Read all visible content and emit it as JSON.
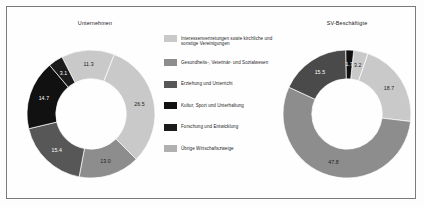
{
  "figure": {
    "background_color": "#fefefe",
    "border_color": "#7a7a7a"
  },
  "charts": {
    "left": {
      "title": "Unternehmen"
    },
    "right": {
      "title": "SV-Beschäftigte"
    }
  },
  "legend": {
    "items": [
      {
        "label": "Interessenvertretungen sowie kirchliche und sonstige Vereinigungen",
        "color": "#c9c9c9"
      },
      {
        "label": "Gesundheits-, Veterinär- und Sozialwesen",
        "color": "#8d8d8d"
      },
      {
        "label": "Erziehung und Unterricht",
        "color": "#575757"
      },
      {
        "label": "Kultur, Sport und Unterhaltung",
        "color": "#111111"
      },
      {
        "label": "Forschung und Entwicklung",
        "color": "#1b1b1b"
      },
      {
        "label": "Übrige Wirtschaftszweige",
        "color": "#b0b0b0"
      }
    ]
  },
  "chart_data": [
    {
      "type": "pie",
      "title": "Unternehmen",
      "donut": true,
      "hole_ratio": 0.55,
      "categories": [
        "Interessenvertretungen sowie kirchliche und sonstige Vereinigungen",
        "Übrige Wirtschaftszweige",
        "Gesundheits-, Veterinär- und Sozialwesen",
        "Erziehung und Unterricht",
        "Kultur, Sport und Unterhaltung",
        "Forschung und Entwicklung"
      ],
      "values": [
        11.3,
        26.5,
        13.0,
        15.4,
        14.7,
        3.1
      ],
      "labels": [
        "11.3",
        "26.5",
        "13.0",
        "15.4",
        "14.7",
        "3.1"
      ],
      "colors": [
        "#c9c9c9",
        "#c9c9c9",
        "#8d8d8d",
        "#575757",
        "#111111",
        "#1b1b1b"
      ],
      "label_colors": [
        "dark",
        "dark",
        "dark",
        "light",
        "light",
        "light"
      ],
      "legend_position": "center"
    },
    {
      "type": "pie",
      "title": "SV-Beschäftigte",
      "donut": true,
      "hole_ratio": 0.55,
      "categories": [
        "Interessenvertretungen sowie kirchliche und sonstige Vereinigungen",
        "Übrige Wirtschaftszweige",
        "Erziehung und Unterricht",
        "Kultur, Sport und Unterhaltung",
        "Forschung und Entwicklung"
      ],
      "values": [
        3.2,
        18.7,
        47.8,
        15.5,
        1.7
      ],
      "labels": [
        "3.2",
        "18.7",
        "47.8",
        "15.5",
        "1.7"
      ],
      "colors": [
        "#c9c9c9",
        "#c9c9c9",
        "#8d8d8d",
        "#4a4a4a",
        "#111111"
      ],
      "label_colors": [
        "dark",
        "dark",
        "dark",
        "light",
        "light"
      ],
      "legend_position": "center"
    }
  ]
}
